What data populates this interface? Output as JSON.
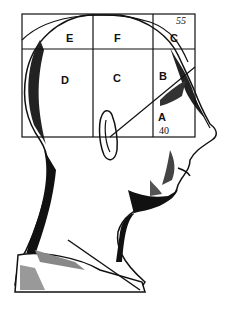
{
  "figure": {
    "regions": [
      {
        "id": "E",
        "label": "E"
      },
      {
        "id": "F",
        "label": "F"
      },
      {
        "id": "C-top",
        "label": "C"
      },
      {
        "id": "D",
        "label": "D"
      },
      {
        "id": "C-mid",
        "label": "C"
      },
      {
        "id": "B",
        "label": "B"
      },
      {
        "id": "A",
        "label": "A"
      }
    ],
    "angle_top": "55",
    "angle_bottom": "40"
  }
}
